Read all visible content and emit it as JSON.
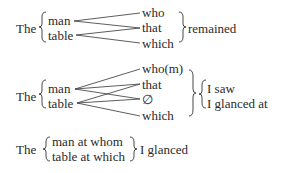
{
  "diagram1": {
    "determiner": "The",
    "nouns": [
      "man",
      "table"
    ],
    "relatives": [
      "who",
      "that",
      "which"
    ],
    "predicate": "remained"
  },
  "diagram2": {
    "determiner": "The",
    "nouns": [
      "man",
      "table"
    ],
    "relatives": [
      "who(m)",
      "that",
      "∅",
      "which"
    ],
    "predicates": [
      "I saw",
      "I glanced at"
    ]
  },
  "diagram3": {
    "determiner": "The",
    "phrases": [
      "man at whom",
      "table at which"
    ],
    "predicate": "I glanced"
  }
}
